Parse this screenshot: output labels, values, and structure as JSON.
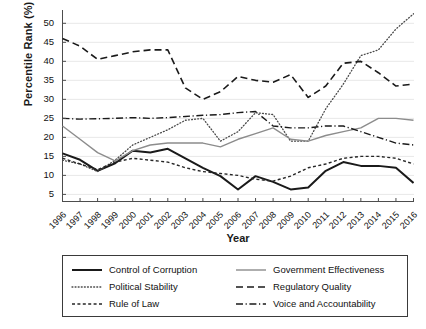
{
  "chart_data": {
    "type": "line",
    "title": "",
    "xlabel": "Year",
    "ylabel": "Percentile Rank (%)",
    "x": [
      1996,
      1997,
      1998,
      1999,
      2000,
      2001,
      2002,
      2003,
      2004,
      2005,
      2006,
      2007,
      2008,
      2009,
      2010,
      2011,
      2012,
      2013,
      2014,
      2015,
      2016
    ],
    "xtick_labels": [
      "1996",
      "1997",
      "1998",
      "1999",
      "2000",
      "2001",
      "2002",
      "2003",
      "2004",
      "2005",
      "2006",
      "2007",
      "2008",
      "2009",
      "2010",
      "2011",
      "2012",
      "2013",
      "2014",
      "2015",
      "2016"
    ],
    "ytick_labels": [
      "5",
      "10",
      "15",
      "20",
      "25",
      "30",
      "35",
      "40",
      "45",
      "50"
    ],
    "yticks": [
      5,
      10,
      15,
      20,
      25,
      30,
      35,
      40,
      45,
      50
    ],
    "ylim": [
      3,
      53.5
    ],
    "xlim": [
      1996,
      2016
    ],
    "grid": "horizontal",
    "legend_position": "below-plot",
    "legend_columns": 2,
    "series": [
      {
        "name": "Control of Corruption",
        "style": "solid",
        "color": "#1a1a1a",
        "width": 2.0,
        "values": [
          15.8,
          14.1,
          11.2,
          13.2,
          16.5,
          16.0,
          17.0,
          14.5,
          12.0,
          9.8,
          6.3,
          9.8,
          8.3,
          6.3,
          6.8,
          11.2,
          13.5,
          12.5,
          12.5,
          12.0,
          8.0
        ]
      },
      {
        "name": "Political Stability",
        "style": "dotted",
        "color": "#4a4a4a",
        "width": 1.3,
        "values": [
          14.0,
          13.0,
          11.0,
          14.0,
          18.0,
          20.0,
          22.0,
          24.5,
          25.0,
          19.0,
          21.5,
          26.5,
          26.0,
          19.0,
          19.0,
          27.5,
          34.0,
          41.5,
          43.0,
          48.5,
          52.5
        ]
      },
      {
        "name": "Rule of Law",
        "style": "dashed-small",
        "color": "#262626",
        "width": 1.4,
        "values": [
          14.5,
          13.0,
          11.5,
          13.5,
          14.5,
          14.0,
          13.5,
          12.0,
          11.0,
          10.5,
          10.0,
          9.0,
          8.5,
          9.8,
          12.0,
          13.0,
          14.5,
          15.0,
          15.0,
          14.5,
          13.0
        ]
      },
      {
        "name": "Government Effectiveness",
        "style": "solid",
        "color": "#8c8c8c",
        "width": 1.4,
        "values": [
          23.0,
          19.5,
          16.0,
          13.8,
          16.5,
          18.0,
          18.5,
          18.5,
          18.5,
          17.5,
          19.5,
          21.0,
          22.5,
          19.5,
          19.0,
          20.5,
          21.5,
          22.5,
          25.0,
          25.0,
          24.5
        ]
      },
      {
        "name": "Regulatory Quality",
        "style": "dashed-long",
        "color": "#1a1a1a",
        "width": 1.6,
        "values": [
          46.0,
          44.0,
          40.5,
          41.5,
          42.5,
          43.0,
          43.0,
          33.0,
          30.0,
          32.0,
          36.0,
          35.0,
          34.5,
          36.5,
          30.5,
          33.5,
          39.5,
          40.0,
          37.0,
          33.5,
          34.0
        ]
      },
      {
        "name": "Voice and Accountability",
        "style": "dashdot",
        "color": "#1a1a1a",
        "width": 1.4,
        "values": [
          25.0,
          24.8,
          24.9,
          25.0,
          25.2,
          25.0,
          25.2,
          25.5,
          25.8,
          26.0,
          26.5,
          26.8,
          23.0,
          22.5,
          22.5,
          23.0,
          23.0,
          21.5,
          20.0,
          18.5,
          18.0
        ]
      }
    ]
  },
  "legend": {
    "items": [
      {
        "label": "Control of Corruption"
      },
      {
        "label": "Government Effectiveness"
      },
      {
        "label": "Political Stability"
      },
      {
        "label": "Regulatory Quality"
      },
      {
        "label": "Rule of Law"
      },
      {
        "label": "Voice and Accountability"
      }
    ]
  },
  "axes": {
    "x_title": "Year",
    "y_title": "Percentile Rank (%)"
  }
}
